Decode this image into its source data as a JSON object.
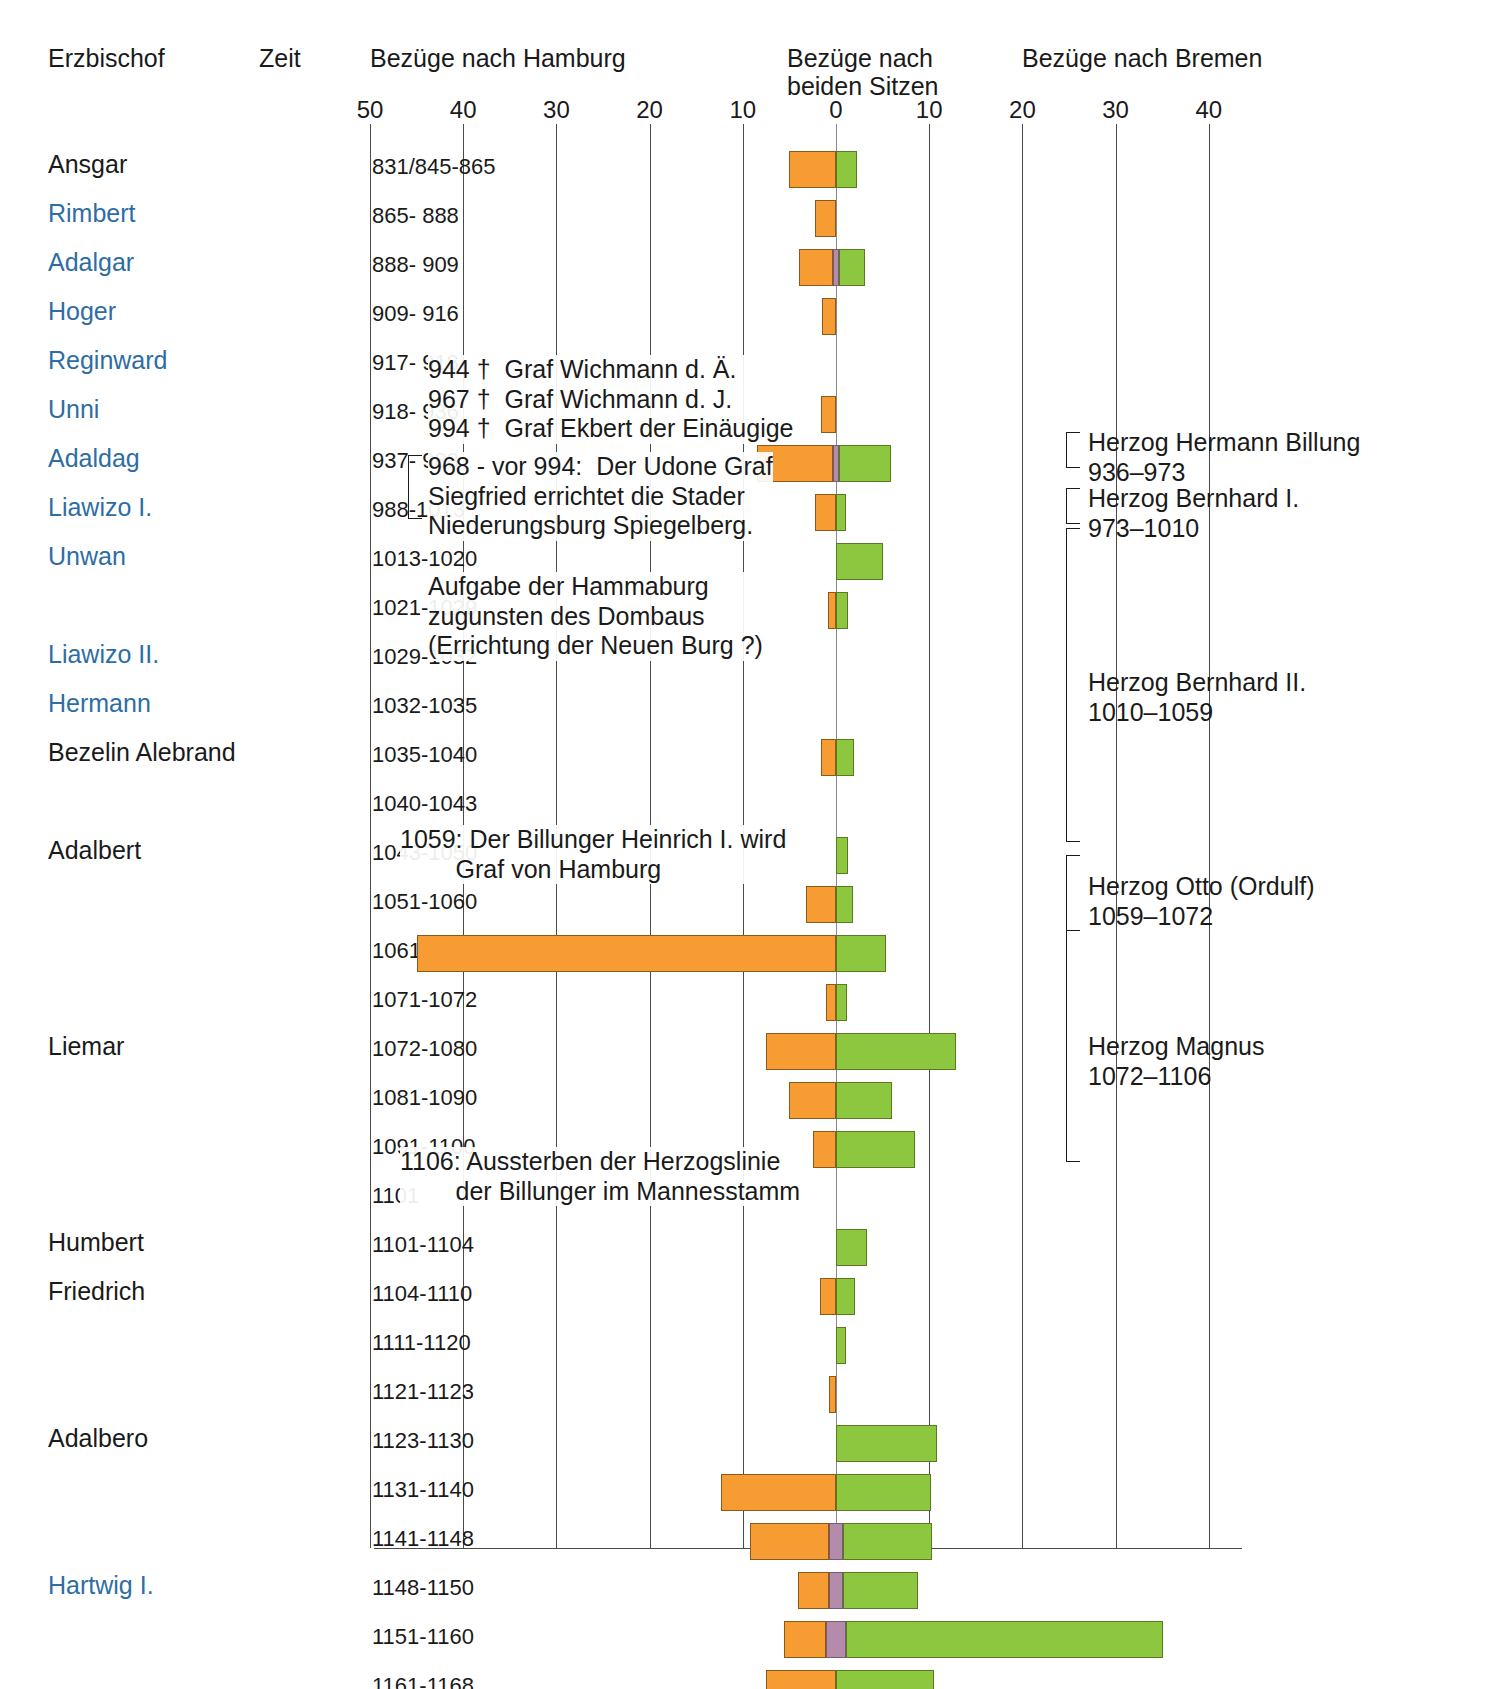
{
  "header": {
    "col_bishop": "Erzbischof",
    "col_time": "Zeit",
    "axis_left_title": "Bezüge nach Hamburg",
    "axis_center_title_l1": "Bezüge nach",
    "axis_center_title_l2": "beiden Sitzen",
    "axis_right_title": "Bezüge nach Bremen"
  },
  "axis": {
    "ticks": [
      "50",
      "40",
      "30",
      "20",
      "10",
      "0",
      "10",
      "20",
      "30",
      "40"
    ]
  },
  "colors": {
    "hamburg": "#F79C33",
    "bremen": "#8DC63F",
    "both": "#B58BAC",
    "bishop_highlight": "#2e6da4",
    "bishop_normal": "#1a1a1a"
  },
  "chart_data": {
    "type": "bar",
    "orientation": "horizontal-diverging",
    "xlabel_left": "Bezüge nach Hamburg",
    "xlabel_center": "Bezüge nach beiden Sitzen",
    "xlabel_right": "Bezüge nach Bremen",
    "xlim": [
      -50,
      45
    ],
    "xticks": [
      -50,
      -40,
      -30,
      -20,
      -10,
      0,
      10,
      20,
      30,
      40
    ],
    "grid": true,
    "legend_position": "none",
    "series": [
      {
        "name": "Bezüge nach Hamburg",
        "color": "#F79C33",
        "direction": "left"
      },
      {
        "name": "Bezüge nach beiden Sitzen",
        "color": "#B58BAC",
        "direction": "center"
      },
      {
        "name": "Bezüge nach Bremen",
        "color": "#8DC63F",
        "direction": "right"
      }
    ],
    "rows": [
      {
        "bishop": "Ansgar",
        "highlight": false,
        "period": "831/845-865",
        "hamburg": 5.0,
        "both": 0,
        "bremen": 2.2
      },
      {
        "bishop": "Rimbert",
        "highlight": true,
        "period": "865-  888",
        "hamburg": 2.2,
        "both": 0,
        "bremen": 0
      },
      {
        "bishop": "Adalgar",
        "highlight": true,
        "period": "888-  909",
        "hamburg": 3.7,
        "both": 0.6,
        "bremen": 2.8
      },
      {
        "bishop": "Hoger",
        "highlight": true,
        "period": "909-  916",
        "hamburg": 1.5,
        "both": 0,
        "bremen": 0
      },
      {
        "bishop": "Reginward",
        "highlight": true,
        "period": "917-  918",
        "hamburg": 0,
        "both": 0,
        "bremen": 0
      },
      {
        "bishop": "Unni",
        "highlight": true,
        "period": "918-  936",
        "hamburg": 1.6,
        "both": 0,
        "bremen": 0
      },
      {
        "bishop": "Adaldag",
        "highlight": true,
        "period": "937-  988",
        "hamburg": 8.2,
        "both": 0.6,
        "bremen": 5.6
      },
      {
        "bishop": "Liawizo I.",
        "highlight": true,
        "period": "988-1013",
        "hamburg": 2.2,
        "both": 0,
        "bremen": 1.1
      },
      {
        "bishop": "Unwan",
        "highlight": true,
        "period": "1013-1020",
        "hamburg": 0,
        "both": 0,
        "bremen": 5.0
      },
      {
        "bishop": "",
        "highlight": true,
        "period": "1021-1029",
        "hamburg": 0.9,
        "both": 0,
        "bremen": 1.3
      },
      {
        "bishop": "Liawizo II.",
        "highlight": true,
        "period": "1029-1032",
        "hamburg": 0,
        "both": 0,
        "bremen": 0
      },
      {
        "bishop": "Hermann",
        "highlight": true,
        "period": "1032-1035",
        "hamburg": 0,
        "both": 0,
        "bremen": 0
      },
      {
        "bishop": "Bezelin Alebrand",
        "highlight": false,
        "period": "1035-1040",
        "hamburg": 1.6,
        "both": 0,
        "bremen": 1.9
      },
      {
        "bishop": "",
        "highlight": false,
        "period": "1040-1043",
        "hamburg": 0,
        "both": 0,
        "bremen": 0
      },
      {
        "bishop": "Adalbert",
        "highlight": false,
        "period": "1043-1050",
        "hamburg": 0,
        "both": 0,
        "bremen": 1.3
      },
      {
        "bishop": "",
        "highlight": false,
        "period": "1051-1060",
        "hamburg": 3.2,
        "both": 0,
        "bremen": 1.8
      },
      {
        "bishop": "",
        "highlight": false,
        "period": "1061-1070",
        "hamburg": 45.0,
        "both": 0,
        "bremen": 5.4
      },
      {
        "bishop": "",
        "highlight": false,
        "period": "1071-1072",
        "hamburg": 1.1,
        "both": 0,
        "bremen": 1.2
      },
      {
        "bishop": "Liemar",
        "highlight": false,
        "period": "1072-1080",
        "hamburg": 7.5,
        "both": 0,
        "bremen": 12.9
      },
      {
        "bishop": "",
        "highlight": false,
        "period": "1081-1090",
        "hamburg": 5.0,
        "both": 0,
        "bremen": 6.0
      },
      {
        "bishop": "",
        "highlight": false,
        "period": "1091-1100",
        "hamburg": 2.5,
        "both": 0,
        "bremen": 8.5
      },
      {
        "bishop": "",
        "highlight": false,
        "period": "1101",
        "hamburg": 0,
        "both": 0,
        "bremen": 0
      },
      {
        "bishop": "Humbert",
        "highlight": false,
        "period": "1101-1104",
        "hamburg": 0,
        "both": 0,
        "bremen": 3.3
      },
      {
        "bishop": "Friedrich",
        "highlight": false,
        "period": "1104-1110",
        "hamburg": 1.7,
        "both": 0,
        "bremen": 2.0
      },
      {
        "bishop": "",
        "highlight": false,
        "period": "1111-1120",
        "hamburg": 0,
        "both": 0,
        "bremen": 1.1
      },
      {
        "bishop": "",
        "highlight": false,
        "period": "1121-1123",
        "hamburg": 0.7,
        "both": 0,
        "bremen": 0
      },
      {
        "bishop": "Adalbero",
        "highlight": false,
        "period": "1123-1130",
        "hamburg": 0,
        "both": 0,
        "bremen": 10.8
      },
      {
        "bishop": "",
        "highlight": false,
        "period": "1131-1140",
        "hamburg": 12.3,
        "both": 0,
        "bremen": 10.2
      },
      {
        "bishop": "",
        "highlight": false,
        "period": "1141-1148",
        "hamburg": 8.5,
        "both": 1.5,
        "bremen": 9.5
      },
      {
        "bishop": "Hartwig I.",
        "highlight": true,
        "period": "1148-1150",
        "hamburg": 3.3,
        "both": 1.5,
        "bremen": 8.0
      },
      {
        "bishop": "",
        "highlight": false,
        "period": "1151-1160",
        "hamburg": 4.5,
        "both": 2.2,
        "bremen": 34.0
      },
      {
        "bishop": "",
        "highlight": false,
        "period": "1161-1168",
        "hamburg": 7.5,
        "both": 0,
        "bremen": 10.5
      }
    ]
  },
  "annotations": [
    {
      "id": "wichmann",
      "lines": "944 †  Graf Wichmann d. Ä.\n967 †  Graf Wichmann d. J.\n994 †  Graf Ekbert der Einäugige"
    },
    {
      "id": "udone",
      "lines": "968 - vor 994:  Der Udone Graf\nSiegfried errichtet die Stader\nNiederungsburg Spiegelberg."
    },
    {
      "id": "hammaburg",
      "lines": "Aufgabe der Hammaburg\nzugunsten des Dombaus\n(Errichtung der Neuen Burg ?)"
    },
    {
      "id": "billunger",
      "lines": "1059: Der Billunger Heinrich I. wird\n        Graf von Hamburg"
    },
    {
      "id": "aussterben",
      "lines": "1106: Aussterben der Herzogslinie\n        der Billunger im Mannesstamm"
    }
  ],
  "dukes": [
    {
      "id": "hermann-billung",
      "name": "Herzog Hermann Billung",
      "years": "936–973"
    },
    {
      "id": "bernhard-i",
      "name": "Herzog Bernhard I.",
      "years": "973–1010"
    },
    {
      "id": "bernhard-ii",
      "name": "Herzog Bernhard II.",
      "years": "1010–1059"
    },
    {
      "id": "otto-ordulf",
      "name": "Herzog Otto (Ordulf)",
      "years": "1059–1072"
    },
    {
      "id": "magnus",
      "name": "Herzog Magnus",
      "years": "1072–1106"
    }
  ]
}
